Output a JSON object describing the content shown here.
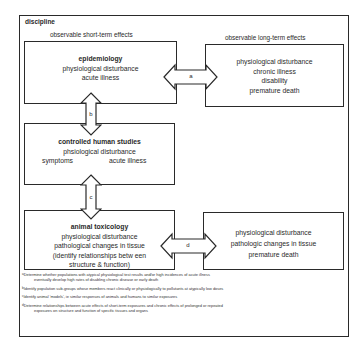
{
  "diagram": {
    "title": "discipline",
    "header_short_term": "observable short-term effects",
    "header_long_term": "observable long-term effects",
    "boxes": {
      "epidemiology": {
        "name": "epidemiology",
        "lines": [
          "physiological disturbance",
          "acute illness"
        ]
      },
      "long_term_top": {
        "lines": [
          "physiological disturbance",
          "chronic illness",
          "disability",
          "premature death"
        ]
      },
      "controlled_human": {
        "name": "controlled human studies",
        "line1": "phsiological disturbance",
        "line2_left": "symptoms",
        "line2_right": "acute illness"
      },
      "animal_toxicology": {
        "name": "animal toxicology",
        "lines": [
          "physiological disturbance",
          "pathological changes in tissue",
          "(identify relationships betw  een",
          "structure &  function)"
        ]
      },
      "long_term_bottom": {
        "lines": [
          "physiological disturbance",
          "pathologic changes in tissue",
          "premature death"
        ]
      }
    },
    "arrows": {
      "a": "a",
      "b": "b",
      "c": "c",
      "d": "d"
    },
    "footnotes": [
      {
        "marker": "a",
        "line1": "Determine whether populations with atypical physiological test results and/or high incidences of acute illness",
        "line2": "eventually develop high rates of disabling chronic disease or early death"
      },
      {
        "marker": "b",
        "line1": "Identify population sub-groups whose members react clinically or physiologically to pollutants at atypically low doses"
      },
      {
        "marker": "c",
        "line1": "Identify animal 'models', ie similar responses of animals and humans to similar exposures"
      },
      {
        "marker": "d",
        "line1": "Determine relationships between acute effects of short-term exposures and chronic effects of prolonged or repeated",
        "line2": "exposures on structure and function of specific tissues and organs"
      }
    ]
  }
}
